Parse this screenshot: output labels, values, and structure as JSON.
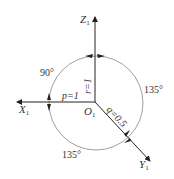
{
  "diagram": {
    "axes": {
      "z": {
        "label": "Z",
        "sub": "1"
      },
      "x": {
        "label": "X",
        "sub": "1"
      },
      "y": {
        "label": "Y",
        "sub": "1"
      },
      "origin": {
        "label": "O",
        "sub": "1"
      }
    },
    "params": {
      "p": "p=1",
      "r": "r=1",
      "q": "q=0.5"
    },
    "angles": {
      "upper_left": "90°",
      "right": "135°",
      "lower": "135°"
    },
    "colors": {
      "line": "#333333",
      "circle": "#777777",
      "background": "#ffffff"
    }
  }
}
